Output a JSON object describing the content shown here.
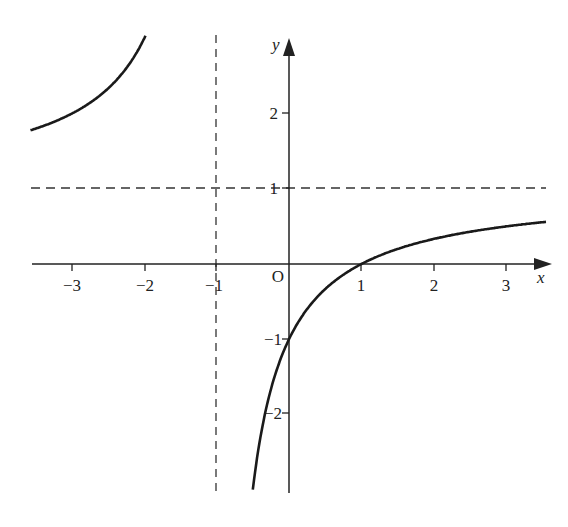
{
  "chart_data": {
    "type": "line",
    "title": "",
    "function": "y = (x - 1)/(x + 1)",
    "xlabel": "x",
    "ylabel": "y",
    "origin_label": "O",
    "xlim": [
      -3.55,
      3.55
    ],
    "ylim": [
      -3.1,
      3.0
    ],
    "grid": false,
    "x_ticks": [
      -3,
      -2,
      -1,
      1,
      2,
      3
    ],
    "x_tick_labels": [
      "−3",
      "−2",
      "−1",
      "1",
      "2",
      "3"
    ],
    "y_ticks": [
      2,
      1,
      -1,
      -2
    ],
    "y_tick_labels": [
      "2",
      "1",
      "−1",
      "−2"
    ],
    "asymptotes": [
      {
        "type": "vertical",
        "x": -1,
        "style": "dashed"
      },
      {
        "type": "horizontal",
        "y": 1,
        "style": "dashed"
      }
    ],
    "series": [
      {
        "name": "left-branch",
        "x": [
          -3.55,
          -3.0,
          -2.5,
          -2.0,
          -1.75,
          -1.5,
          -1.4,
          -1.3
        ],
        "y": [
          1.78,
          2.0,
          2.33,
          3.0,
          3.67,
          5.0,
          6.0,
          7.67
        ]
      },
      {
        "name": "right-branch",
        "x": [
          -0.8,
          -0.6,
          -0.4,
          -0.2,
          0,
          0.5,
          1,
          1.5,
          2,
          2.5,
          3,
          3.55
        ],
        "y": [
          -9.0,
          -4.0,
          -2.33,
          -1.5,
          -1.0,
          -0.33,
          0,
          0.2,
          0.33,
          0.43,
          0.5,
          0.56
        ]
      }
    ],
    "key_points": [
      {
        "label": "y-intercept",
        "x": 0,
        "y": -1
      },
      {
        "label": "x-intercept",
        "x": 1,
        "y": 0
      }
    ]
  }
}
